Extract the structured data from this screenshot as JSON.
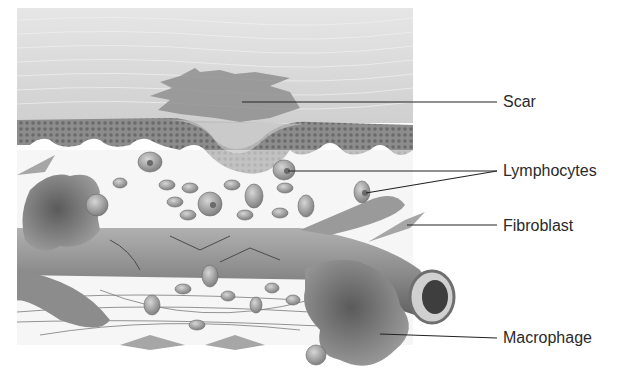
{
  "figure": {
    "type": "anatomical-illustration",
    "colors": {
      "background": "#ffffff",
      "tissue_surface": "#d9d9d9",
      "epidermis": "#8a8a8a",
      "dermis": "#eeeeee",
      "vessel": "#7e7e7e",
      "cell": "#9a9a9a",
      "macrophage": "#6f6f6f",
      "leader_line": "#222222",
      "label_text": "#2a2a2a"
    }
  },
  "labels": [
    {
      "id": "scar",
      "text": "Scar"
    },
    {
      "id": "lymphocytes",
      "text": "Lymphocytes"
    },
    {
      "id": "fibroblast",
      "text": "Fibroblast"
    },
    {
      "id": "macrophage",
      "text": "Macrophage"
    }
  ]
}
